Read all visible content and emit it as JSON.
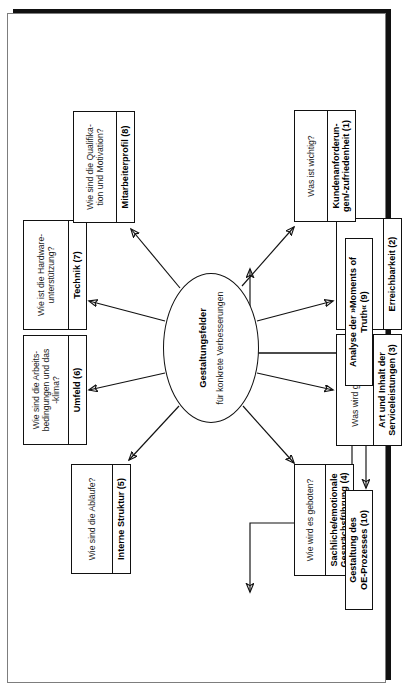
{
  "diagram": {
    "title": "Gestaltungsfelder für konkrete Verbesserungen",
    "orientation": "rotated-90-ccw",
    "hub": {
      "line1": "Gestaltungsfelder",
      "line2": "für konkrete Verbesserungen"
    },
    "nodes": [
      {
        "id": 1,
        "question": "Was ist wichtig?",
        "label": "Kundenanforderun-\ngen/-zufriedenheit (1)"
      },
      {
        "id": 2,
        "question": "Wann kommt der\nKontakt zustande?",
        "label": "Erreichbarkeit (2)"
      },
      {
        "id": 3,
        "question": "Was wird geboten?",
        "label": "Art und Inhalt der\nServiceleistungen (3)"
      },
      {
        "id": 4,
        "question": "Wie wird es geboten?",
        "label": "Sachliche/emotionale\nGesprächsführung (4)"
      },
      {
        "id": 5,
        "question": "Wie sind die Abläufe?",
        "label": "Interne Struktur (5)"
      },
      {
        "id": 6,
        "question": "Wie sind die Arbeits-\nbedingungen und das\n-klima?",
        "label": "Umfeld (6)"
      },
      {
        "id": 7,
        "question": "Wie ist die Hardware-\nunterstützung?",
        "label": "Technik (7)"
      },
      {
        "id": 8,
        "question": "Wie sind die Qualifika-\ntion und Motivation?",
        "label": "Mitarbeiterprofil (8)"
      }
    ],
    "process": [
      {
        "id": 9,
        "label": "Analyse der »Moments of\nTruth« (9)"
      },
      {
        "id": 10,
        "label": "Gestaltung des\nOE-Prozesses (10)"
      }
    ],
    "colors": {
      "stroke": "#111111",
      "frame": "#7d7d7d",
      "background": "#ffffff",
      "shadow": "#111111"
    }
  }
}
